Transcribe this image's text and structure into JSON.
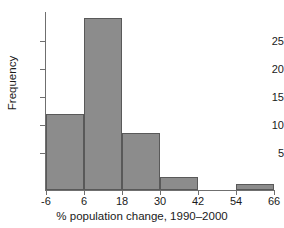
{
  "chart_data": {
    "type": "bar",
    "title": "",
    "subtitle": "",
    "xlabel": "% population change, 1990–2000",
    "ylabel": "Frequency",
    "bin_edges": [
      -6,
      6,
      18,
      30,
      42,
      54,
      66
    ],
    "bin_width": 12,
    "categories": [
      "-6 to 6",
      "6 to 18",
      "18 to 30",
      "30 to 42",
      "42 to 54",
      "54 to 66"
    ],
    "values": [
      12,
      27,
      9,
      2,
      0,
      1
    ],
    "xlim": [
      -6,
      66
    ],
    "ylim": [
      0,
      28
    ],
    "x_ticks": [
      -6,
      6,
      18,
      30,
      42,
      54,
      66
    ],
    "x_tick_labels": [
      "-6",
      "6",
      "18",
      "30",
      "42",
      "54",
      "66"
    ],
    "y_ticks": [
      5,
      10,
      15,
      20,
      25
    ],
    "y_tick_labels": [
      "5",
      "10",
      "15",
      "20",
      "25"
    ],
    "grid": false,
    "legend": null,
    "bar_fill_color": "#8c8c8c",
    "bar_edge_color": "#595959",
    "axis_color": "#6f6f6f",
    "background_color": "#ffffff"
  }
}
